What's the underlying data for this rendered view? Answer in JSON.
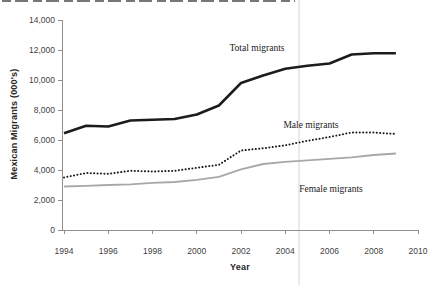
{
  "colors": {
    "background": "#ffffff",
    "axis": "#909090",
    "tick_text": "#3f3f3f",
    "axis_title_text": "#262626",
    "series_label_text": "#1a1a1a",
    "column_divider": "#eaeaea",
    "top_crop_strip": "#5f5f5f"
  },
  "chart_data": {
    "type": "line",
    "title": "",
    "xlabel": "Year",
    "ylabel": "Mexican Migrants (000's)",
    "xlim": [
      1994,
      2010
    ],
    "ylim": [
      0,
      14000
    ],
    "grid": false,
    "legend_position": "inline-annotations",
    "x_ticks": [
      1994,
      1996,
      1998,
      2000,
      2002,
      2004,
      2006,
      2008,
      2010
    ],
    "y_ticks": [
      0,
      2000,
      4000,
      6000,
      8000,
      10000,
      12000,
      14000
    ],
    "y_tick_labels": [
      "0",
      "2,000",
      "4,000",
      "6,000",
      "8,000",
      "10,000",
      "12,000",
      "14,000"
    ],
    "x": [
      1994,
      1995,
      1996,
      1997,
      1998,
      1999,
      2000,
      2001,
      2002,
      2003,
      2004,
      2005,
      2006,
      2007,
      2008,
      2009
    ],
    "series": [
      {
        "name": "Total migrants",
        "line_style": "solid",
        "color": "#1c1c1c",
        "width": 2.5,
        "values": [
          6450,
          6950,
          6900,
          7300,
          7350,
          7400,
          7700,
          8300,
          9800,
          10300,
          10750,
          10950,
          11100,
          11700,
          11780,
          11780
        ]
      },
      {
        "name": "Male migrants",
        "line_style": "dotted",
        "color": "#1c1c1c",
        "width": 2,
        "values": [
          3500,
          3800,
          3750,
          3950,
          3900,
          3950,
          4150,
          4350,
          5300,
          5450,
          5650,
          5950,
          6200,
          6500,
          6500,
          6400
        ]
      },
      {
        "name": "Female migrants",
        "line_style": "solid",
        "color": "#a8a8a8",
        "width": 1.8,
        "values": [
          2900,
          2950,
          3000,
          3050,
          3150,
          3200,
          3350,
          3550,
          4050,
          4400,
          4550,
          4650,
          4750,
          4850,
          5000,
          5100
        ]
      }
    ],
    "annotations": [
      {
        "text": "Total migrants",
        "x": 257,
        "y": 48
      },
      {
        "text": "Male migrants",
        "x": 311,
        "y": 125
      },
      {
        "text": "Female migrants",
        "x": 331,
        "y": 189
      }
    ]
  }
}
